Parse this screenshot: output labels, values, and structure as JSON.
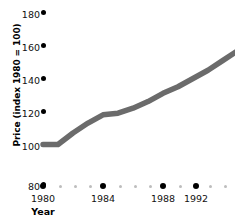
{
  "chart_data": {
    "type": "line",
    "title": "",
    "xlabel": "Year",
    "ylabel": "Price (index 1980 = 100)",
    "xlim": [
      1980,
      1994
    ],
    "ylim": [
      80,
      180
    ],
    "grid": false,
    "legend": null,
    "line_color": "#6b6b6b",
    "marker_color": "#000000",
    "minor_tick_color": "#bdbdbd",
    "y_ticks": [
      180,
      160,
      140,
      120,
      100,
      80
    ],
    "y_tick_labels": [
      "180",
      "160",
      "140",
      "120",
      "100",
      "80"
    ],
    "x_ticks": [
      1980,
      1984,
      1988,
      1992
    ],
    "x_tick_labels": [
      "1980",
      "1984",
      "1988",
      "1992"
    ],
    "x_minor_ticks": [
      1981,
      1982,
      1983,
      1985,
      1986,
      1987,
      1989,
      1990,
      1991,
      1993,
      1994
    ],
    "x": [
      1980,
      1981,
      1982,
      1983,
      1984,
      1985,
      1986,
      1987,
      1988,
      1989,
      1990,
      1991,
      1992,
      1993
    ],
    "values": [
      100,
      100,
      107,
      113,
      118,
      119,
      122,
      126,
      131,
      135,
      140,
      145,
      151,
      157
    ],
    "series": [
      {
        "name": "Price index",
        "values": [
          100,
          100,
          107,
          113,
          118,
          119,
          122,
          126,
          131,
          135,
          140,
          145,
          151,
          157
        ]
      }
    ]
  },
  "axes": {
    "y_title": "Price (index 1980 = 100)",
    "x_title": "Year"
  }
}
